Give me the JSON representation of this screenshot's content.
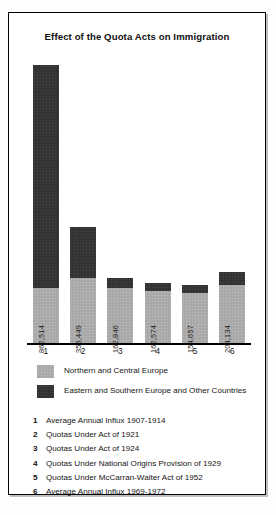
{
  "chart_data": {
    "type": "bar",
    "title": "Effect of the Quota Acts on Immigration",
    "subtitle": "",
    "xlabel": "",
    "ylabel": "",
    "stacked": true,
    "grid": false,
    "legend_position": "bottom",
    "ylim": [
      0,
      900000
    ],
    "categories": [
      "1",
      "2",
      "3",
      "4",
      "5",
      "6"
    ],
    "category_descriptions": [
      "Average Annual Influx 1907-1914",
      "Quotas Under Act of 1921",
      "Quotas Under Act of 1924",
      "Quotas Under National Origins Provision of 1929",
      "Quotas Under McCarran-Walter Act of 1952",
      "Average Annual Influx 1969-1972"
    ],
    "series": [
      {
        "name": "Northern and Central Europe",
        "color": "#a9a9a9",
        "values": [
          862514,
          356449,
          162846,
          162574,
          154657,
          204134
        ]
      },
      {
        "name": "Eastern and Southern Europe and Other Countries",
        "color": "#333333",
        "values": [
          722486,
          488551,
          27154,
          12426,
          19343,
          67866
        ]
      }
    ],
    "data_labels": [
      "862,514",
      "356,449",
      "162,846",
      "162,574",
      "154,657",
      "204,134"
    ],
    "totals": [
      1585000,
      845000,
      190000,
      175000,
      174000,
      272000
    ]
  },
  "bars": [
    {
      "tick": "1",
      "value_label": "862,514",
      "light_px": 55,
      "dark_px": 223
    },
    {
      "tick": "2",
      "value_label": "356,449",
      "light_px": 65,
      "dark_px": 51
    },
    {
      "tick": "3",
      "value_label": "162,846",
      "light_px": 55,
      "dark_px": 10
    },
    {
      "tick": "4",
      "value_label": "162,574",
      "light_px": 52,
      "dark_px": 8
    },
    {
      "tick": "5",
      "value_label": "154,657",
      "light_px": 50,
      "dark_px": 8
    },
    {
      "tick": "6",
      "value_label": "204,134",
      "light_px": 58,
      "dark_px": 13
    }
  ],
  "legend": {
    "items": [
      {
        "label": "Northern and Central Europe",
        "color": "#a9a9a9",
        "swatch": "light-gray-swatch"
      },
      {
        "label": "Eastern and Southern Europe and Other Countries",
        "color": "#333333",
        "swatch": "dark-gray-swatch"
      }
    ]
  },
  "captions": [
    {
      "num": "1",
      "text": "Average Annual Influx 1907-1914"
    },
    {
      "num": "2",
      "text": "Quotas Under Act of 1921"
    },
    {
      "num": "3",
      "text": "Quotas Under Act of 1924"
    },
    {
      "num": "4",
      "text": "Quotas Under National Origins Provision of 1929"
    },
    {
      "num": "5",
      "text": "Quotas Under McCarran-Walter Act of 1952"
    },
    {
      "num": "6",
      "text": "Average Annual Influx 1969-1972"
    }
  ]
}
